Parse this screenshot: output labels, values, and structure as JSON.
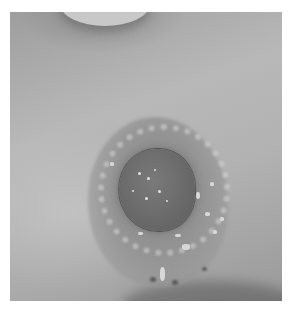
{
  "image": {
    "description": "Grayscale clinical photograph of a circular skin lesion with crusting on a body surface",
    "palette": {
      "background": "#ffffff",
      "skin": "#b2b2b2",
      "lesion": "#6a6a6a",
      "crust": "#e0e0e0"
    }
  }
}
